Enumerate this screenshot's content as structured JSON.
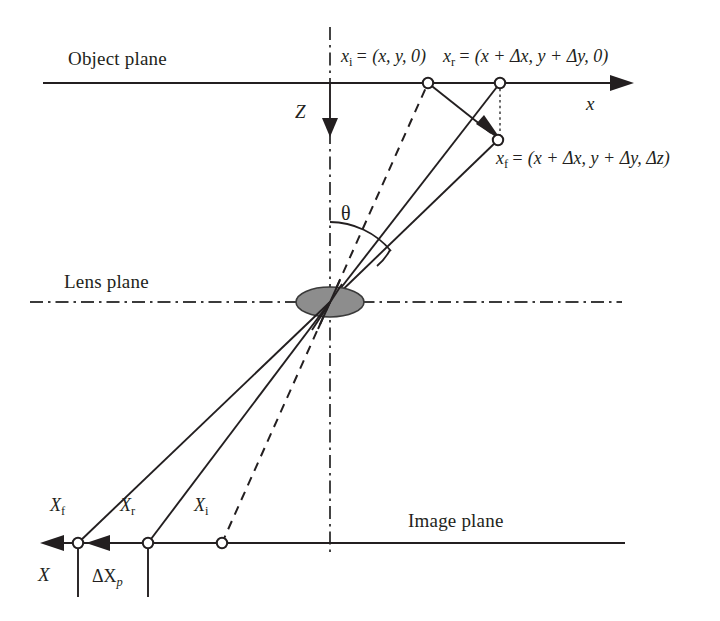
{
  "figure": {
    "type": "optical-ray-diagram",
    "background_color": "#ffffff",
    "ink_color": "#231f20",
    "lens_fill_color": "#8d8d8d"
  },
  "planes": {
    "object_plane_label": "Object plane",
    "lens_plane_label": "Lens plane",
    "image_plane_label": "Image plane"
  },
  "axes": {
    "x_label": "x",
    "z_label": "Z",
    "X_label": "X",
    "theta_label": "θ"
  },
  "object_points": {
    "xi_label": "x",
    "xi_sub": "i",
    "xi_value": "= (x, y, 0)",
    "xr_label": "x",
    "xr_sub": "r",
    "xr_value": "= (x + Δx, y + Δy, 0)",
    "xf_label": "x",
    "xf_sub": "f",
    "xf_value": "= (x + Δx, y + Δy, Δz)"
  },
  "image_points": {
    "Xf_label": "X",
    "Xf_sub": "f",
    "Xr_label": "X",
    "Xr_sub": "r",
    "Xi_label": "X",
    "Xi_sub": "i",
    "delta_label": "ΔX",
    "delta_sub": "p"
  },
  "geometry": {
    "optical_axis_x": 330,
    "object_plane_y": 83,
    "lens_plane_y": 302,
    "image_plane_y": 543,
    "lens_center": [
      330,
      302
    ],
    "node_xi": [
      428,
      83
    ],
    "node_xr": [
      500,
      83
    ],
    "node_xf": [
      498,
      140
    ],
    "node_Xf": [
      78,
      543
    ],
    "node_Xr": [
      148,
      543
    ],
    "node_Xi": [
      222,
      543
    ]
  }
}
